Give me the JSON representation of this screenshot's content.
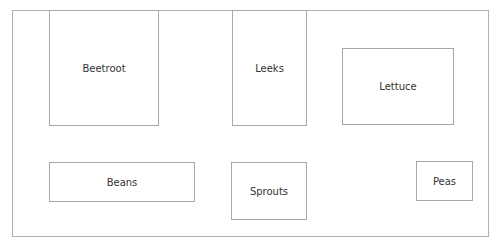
{
  "diagram": {
    "beds": [
      {
        "label": "Beetroot",
        "x": 49,
        "y": 10,
        "w": 110,
        "h": 116
      },
      {
        "label": "Leeks",
        "x": 232,
        "y": 10,
        "w": 75,
        "h": 116
      },
      {
        "label": "Lettuce",
        "x": 342,
        "y": 48,
        "w": 112,
        "h": 77
      },
      {
        "label": "Beans",
        "x": 49,
        "y": 162,
        "w": 146,
        "h": 40
      },
      {
        "label": "Sprouts",
        "x": 231,
        "y": 162,
        "w": 76,
        "h": 58
      },
      {
        "label": "Peas",
        "x": 416,
        "y": 161,
        "w": 57,
        "h": 40
      }
    ]
  }
}
